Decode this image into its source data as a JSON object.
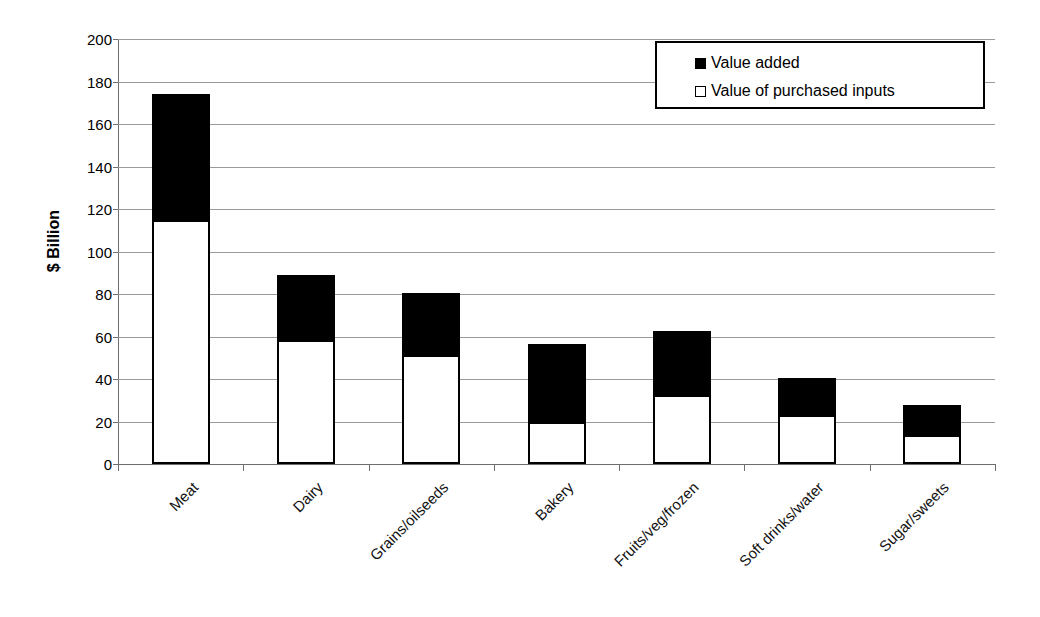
{
  "chart_data": {
    "type": "bar",
    "subtype": "stacked-vertical",
    "title": "",
    "xlabel": "",
    "ylabel": "$ Billion",
    "ylim": [
      0,
      200
    ],
    "ytick_step": 20,
    "yticks": [
      200,
      180,
      160,
      140,
      120,
      100,
      80,
      60,
      40,
      20,
      0
    ],
    "ytick_labels": [
      "200",
      "180",
      "160",
      "140",
      "120",
      "100",
      "80",
      "60",
      "40",
      "20",
      "0"
    ],
    "grid": true,
    "grid_axis": "y",
    "legend_position": "top-right-inside",
    "categories": [
      "Meat",
      "Dairy",
      "Grains/oilseeds",
      "Bakery",
      "Fruits/veg/frozen",
      "Soft drinks/water",
      "Sugar/sweets"
    ],
    "series": [
      {
        "name": "Value of purchased inputs",
        "color": "#ffffff",
        "edge_color": "#000000",
        "values": [
          115,
          58.5,
          51.5,
          20,
          32.5,
          23,
          13.5
        ]
      },
      {
        "name": "Value added",
        "color": "#000000",
        "edge_color": "#000000",
        "values": [
          59,
          30.5,
          29,
          36.5,
          30,
          17.5,
          14.5
        ]
      }
    ],
    "totals": [
      174,
      89,
      80.5,
      56.5,
      62.5,
      40.5,
      28
    ],
    "stack_order_bottom_to_top": [
      "Value of purchased inputs",
      "Value added"
    ]
  },
  "legend": {
    "items": [
      {
        "label": "Value added",
        "swatch": "filled-square-icon",
        "color": "#000000"
      },
      {
        "label": "Value of purchased inputs",
        "swatch": "hollow-square-icon",
        "color": "#ffffff"
      }
    ]
  },
  "axes": {
    "y_title": "$ Billion"
  }
}
